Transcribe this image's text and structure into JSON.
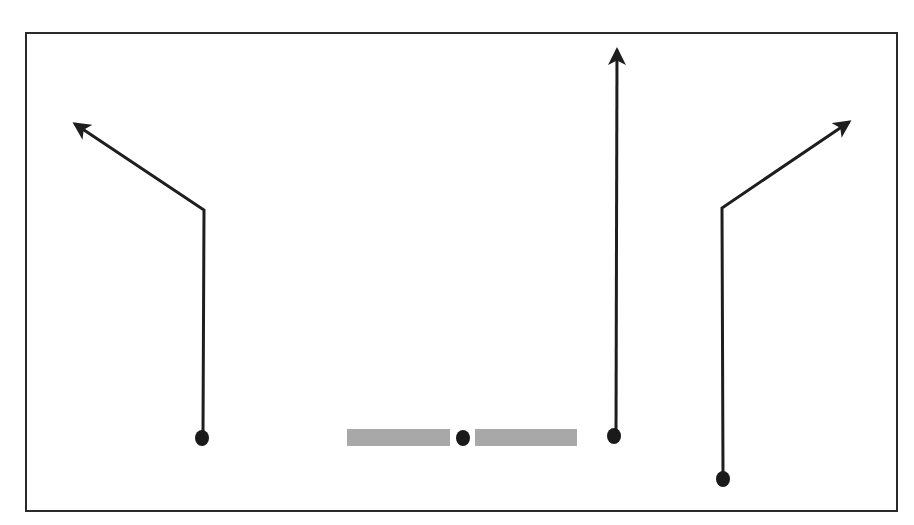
{
  "diagram": {
    "type": "football-play",
    "frame": {
      "x": 26,
      "y": 33,
      "width": 871,
      "height": 478,
      "stroke": "#2a2a2a",
      "stroke_width": 2
    },
    "line_of_scrimmage": {
      "color": "#a8a8a8",
      "bars": [
        {
          "x": 347,
          "y": 429,
          "width": 103,
          "height": 17
        },
        {
          "x": 475,
          "y": 429,
          "width": 102,
          "height": 17
        }
      ]
    },
    "route_color": "#1e1e1e",
    "route_width": 3,
    "player_color": "#1a1a1a",
    "players": [
      {
        "id": "left-receiver",
        "x": 202,
        "y": 438,
        "r": 7
      },
      {
        "id": "center",
        "x": 463,
        "y": 438,
        "r": 7
      },
      {
        "id": "slot-receiver",
        "x": 614,
        "y": 436,
        "r": 7
      },
      {
        "id": "right-receiver",
        "x": 723,
        "y": 479,
        "r": 7
      }
    ],
    "routes": [
      {
        "id": "left-post-corner",
        "player": "left-receiver",
        "points": [
          [
            203,
            434
          ],
          [
            204,
            210
          ],
          [
            75,
            124
          ]
        ]
      },
      {
        "id": "middle-go",
        "player": "slot-receiver",
        "points": [
          [
            616,
            432
          ],
          [
            617,
            50
          ]
        ]
      },
      {
        "id": "right-corner",
        "player": "right-receiver",
        "points": [
          [
            723,
            475
          ],
          [
            722,
            208
          ],
          [
            849,
            122
          ]
        ]
      }
    ]
  }
}
